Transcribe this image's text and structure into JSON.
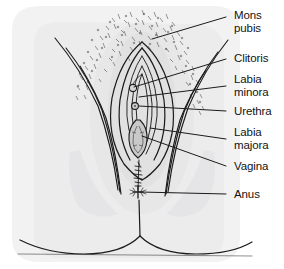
{
  "figure": {
    "kind": "line-drawing",
    "colors": {
      "background": "#ffffff",
      "skin_shade": "#ececed",
      "skin_shade_2": "#e2e2e3",
      "ink": "#1b1b1b",
      "leader_line": "#1b1b1b",
      "hair": "#3a3a3a",
      "text": "#131313"
    }
  },
  "labels": [
    {
      "id": "mons-pubis",
      "text": "Mons\npubis",
      "x": 234,
      "y": 9,
      "leader": {
        "x1": 226,
        "y1": 17,
        "x2": 152,
        "y2": 39
      }
    },
    {
      "id": "clitoris",
      "text": "Clitoris",
      "x": 234,
      "y": 53,
      "leader": {
        "x1": 226,
        "y1": 59,
        "x2": 133,
        "y2": 88
      }
    },
    {
      "id": "labia-minora",
      "text": "Labia\nminora",
      "x": 234,
      "y": 74,
      "leader": {
        "x1": 226,
        "y1": 86,
        "x2": 139,
        "y2": 97
      }
    },
    {
      "id": "urethra",
      "text": "Urethra",
      "x": 234,
      "y": 106,
      "leader": {
        "x1": 226,
        "y1": 111,
        "x2": 135,
        "y2": 106
      }
    },
    {
      "id": "labia-majora",
      "text": "Labia\nmajora",
      "x": 234,
      "y": 128,
      "leader": {
        "x1": 226,
        "y1": 139,
        "x2": 145,
        "y2": 127
      }
    },
    {
      "id": "vagina",
      "text": "Vagina",
      "x": 234,
      "y": 161,
      "leader": {
        "x1": 226,
        "y1": 166,
        "x2": 136,
        "y2": 136
      }
    },
    {
      "id": "anus",
      "text": "Anus",
      "x": 234,
      "y": 189,
      "leader": {
        "x1": 226,
        "y1": 194,
        "x2": 133,
        "y2": 192
      }
    }
  ],
  "label_order": [
    "Mons pubis",
    "Clitoris",
    "Labia minora",
    "Urethra",
    "Labia majora",
    "Vagina",
    "Anus"
  ]
}
